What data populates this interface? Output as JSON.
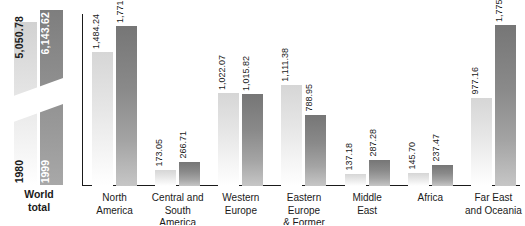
{
  "chart_data": {
    "type": "bar",
    "title": "",
    "xlabel": "",
    "ylabel": "",
    "grid": false,
    "legend_position": "none",
    "axis_break": true,
    "categories": [
      "North America",
      "Central and South America",
      "Western Europe",
      "Eastern Europe & Former USSR",
      "Middle East",
      "Africa",
      "Far East and Oceania"
    ],
    "series": [
      {
        "name": "1980",
        "values": [
          1484.24,
          173.05,
          1022.07,
          1111.38,
          137.18,
          145.7,
          977.16
        ],
        "labels": [
          "1,484.24",
          "173.05",
          "1,022.07",
          "1,111.38",
          "137.18",
          "145.70",
          "977.16"
        ],
        "color": "#d6d6d6"
      },
      {
        "name": "1999",
        "values": [
          1771.54,
          266.71,
          1015.82,
          788.95,
          287.28,
          237.47,
          1775.85
        ],
        "labels": [
          "1,771.54",
          "266.71",
          "1,015.82",
          "788.95",
          "287.28",
          "237.47",
          "1,775.85"
        ],
        "color": "#7a7a7a"
      }
    ],
    "totals": {
      "caption_line1": "World",
      "caption_line2": "total",
      "bars": [
        {
          "year": "1980",
          "value": 5050.78,
          "label": "5,050.78",
          "color": "#d6d6d6"
        },
        {
          "year": "1999",
          "value": 6143.62,
          "label": "6,143.62",
          "color": "#8c8c8c"
        }
      ]
    },
    "ylim": [
      0,
      1900
    ]
  },
  "regions": {
    "north_america": {
      "line1": "North",
      "line2": "America"
    },
    "central_south_america": {
      "line1": "Central and",
      "line2": "South America"
    },
    "western_europe": {
      "line1": "Western",
      "line2": "Europe"
    },
    "eastern_europe": {
      "line1": "Eastern Europe",
      "line2": "& Former USSR"
    },
    "middle_east": {
      "line1": "Middle",
      "line2": "East"
    },
    "africa": {
      "line1": "Africa",
      "line2": ""
    },
    "far_east": {
      "line1": "Far East",
      "line2": "and Oceania"
    }
  }
}
